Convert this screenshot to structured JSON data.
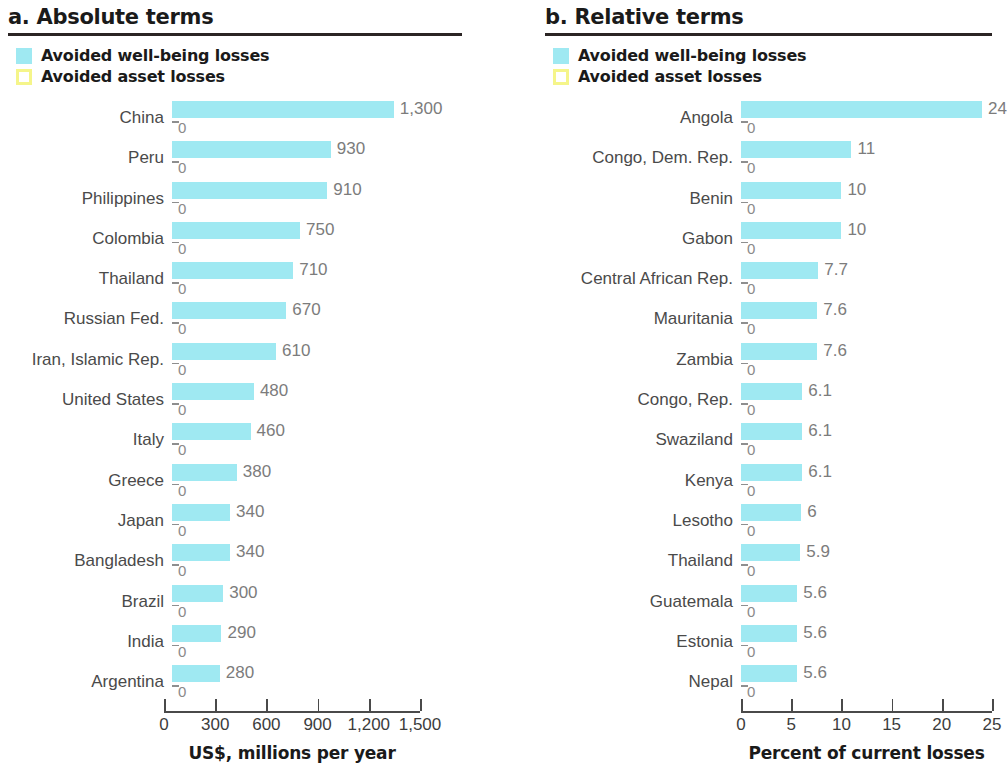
{
  "panels": [
    {
      "id": "absolute",
      "title": "a. Absolute terms",
      "legend": [
        {
          "label": "Avoided well-being losses",
          "swatch": "wellbeing-swatch-icon",
          "color": "#9fe9f2"
        },
        {
          "label": "Avoided asset losses",
          "swatch": "asset-swatch-icon",
          "color": "#f5f58a"
        }
      ],
      "axis_title": "US$, millions per year"
    },
    {
      "id": "relative",
      "title": "b. Relative terms",
      "legend": [
        {
          "label": "Avoided well-being losses",
          "swatch": "wellbeing-swatch-icon",
          "color": "#9fe9f2"
        },
        {
          "label": "Avoided asset losses",
          "swatch": "asset-swatch-icon",
          "color": "#f5f58a"
        }
      ],
      "axis_title": "Percent of current losses"
    }
  ],
  "chart_data": [
    {
      "type": "bar",
      "orientation": "horizontal",
      "title": "a. Absolute terms",
      "xlabel": "US$, millions per year",
      "ylabel": "",
      "xlim": [
        0,
        1500
      ],
      "xticks": [
        0,
        300,
        600,
        900,
        1200,
        1500
      ],
      "xtick_labels": [
        "0",
        "300",
        "600",
        "900",
        "1,200",
        "1,500"
      ],
      "grid": false,
      "legend": [
        "Avoided well-being losses",
        "Avoided asset losses"
      ],
      "legend_position": "top-left",
      "categories": [
        "China",
        "Peru",
        "Philippines",
        "Colombia",
        "Thailand",
        "Russian Fed.",
        "Iran, Islamic Rep.",
        "United States",
        "Italy",
        "Greece",
        "Japan",
        "Bangladesh",
        "Brazil",
        "India",
        "Argentina"
      ],
      "series": [
        {
          "name": "Avoided well-being losses",
          "color": "#9fe9f2",
          "values": [
            1300,
            930,
            910,
            750,
            710,
            670,
            610,
            480,
            460,
            380,
            340,
            340,
            300,
            290,
            280
          ],
          "value_labels": [
            "1,300",
            "930",
            "910",
            "750",
            "710",
            "670",
            "610",
            "480",
            "460",
            "380",
            "340",
            "340",
            "300",
            "290",
            "280"
          ]
        },
        {
          "name": "Avoided asset losses",
          "color": "#f5f58a",
          "values": [
            0,
            0,
            0,
            0,
            0,
            0,
            0,
            0,
            0,
            0,
            0,
            0,
            0,
            0,
            0
          ],
          "value_labels": [
            "0",
            "0",
            "0",
            "0",
            "0",
            "0",
            "0",
            "0",
            "0",
            "0",
            "0",
            "0",
            "0",
            "0",
            "0"
          ]
        }
      ]
    },
    {
      "type": "bar",
      "orientation": "horizontal",
      "title": "b. Relative terms",
      "xlabel": "Percent of current losses",
      "ylabel": "",
      "xlim": [
        0,
        25
      ],
      "xticks": [
        0,
        5,
        10,
        15,
        20,
        25
      ],
      "xtick_labels": [
        "0",
        "5",
        "10",
        "15",
        "20",
        "25"
      ],
      "grid": false,
      "legend": [
        "Avoided well-being losses",
        "Avoided asset losses"
      ],
      "legend_position": "top-left",
      "categories": [
        "Angola",
        "Congo, Dem. Rep.",
        "Benin",
        "Gabon",
        "Central African Rep.",
        "Mauritania",
        "Zambia",
        "Congo, Rep.",
        "Swaziland",
        "Kenya",
        "Lesotho",
        "Thailand",
        "Guatemala",
        "Estonia",
        "Nepal"
      ],
      "series": [
        {
          "name": "Avoided well-being losses",
          "color": "#9fe9f2",
          "values": [
            24,
            11,
            10,
            10,
            7.7,
            7.6,
            7.6,
            6.1,
            6.1,
            6.1,
            6,
            5.9,
            5.6,
            5.6,
            5.6
          ],
          "value_labels": [
            "24",
            "11",
            "10",
            "10",
            "7.7",
            "7.6",
            "7.6",
            "6.1",
            "6.1",
            "6.1",
            "6",
            "5.9",
            "5.6",
            "5.6",
            "5.6"
          ]
        },
        {
          "name": "Avoided asset losses",
          "color": "#f5f58a",
          "values": [
            0,
            0,
            0,
            0,
            0,
            0,
            0,
            0,
            0,
            0,
            0,
            0,
            0,
            0,
            0
          ],
          "value_labels": [
            "0",
            "0",
            "0",
            "0",
            "0",
            "0",
            "0",
            "0",
            "0",
            "0",
            "0",
            "0",
            "0",
            "0",
            "0"
          ]
        }
      ]
    }
  ]
}
